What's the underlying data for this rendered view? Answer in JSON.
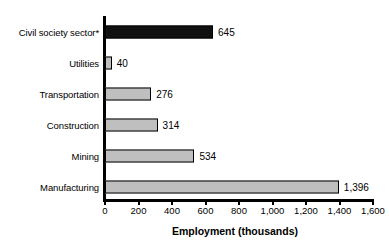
{
  "chart_data": {
    "type": "bar",
    "orientation": "horizontal",
    "title": "",
    "subtitle": "",
    "xlabel": "Employment (thousands)",
    "ylabel": "",
    "xlim": [
      0,
      1600
    ],
    "grid": false,
    "legend": null,
    "categories": [
      "Civil society sector*",
      "Utilities",
      "Transportation",
      "Construction",
      "Mining",
      "Manufacturing"
    ],
    "values": [
      645,
      40,
      276,
      314,
      534,
      1396
    ],
    "value_labels": [
      "645",
      "40",
      "276",
      "314",
      "534",
      "1,396"
    ],
    "bar_colors": [
      "#101010",
      "#bfbfbf",
      "#bfbfbf",
      "#bfbfbf",
      "#bfbfbf",
      "#bfbfbf"
    ],
    "highlight_index": 0,
    "xticks": [
      0,
      200,
      400,
      600,
      800,
      1000,
      1200,
      1400,
      1600
    ],
    "xtick_labels": [
      "0",
      "200",
      "400",
      "600",
      "800",
      "1,000",
      "1,200",
      "1,400",
      "1,600"
    ],
    "note": "*"
  },
  "colors": {
    "bar_fill": "#bfbfbf",
    "bar_highlight": "#101010",
    "bar_stroke": "#000000",
    "axis": "#000000",
    "background": "#ffffff",
    "text": "#000000"
  }
}
